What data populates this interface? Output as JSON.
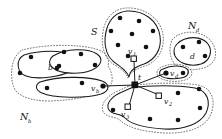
{
  "figure": {
    "background_color": "#ffffff",
    "ink_color": "#111111",
    "dotted_color": "#555555",
    "width": 222,
    "height": 139
  },
  "region_labels": {
    "s": "S",
    "nb_main": "N",
    "nb_sub": "b",
    "nd_main": "N",
    "nd_sub": "d"
  },
  "vertex_labels": {
    "t": "t",
    "v1_main": "v",
    "v1_sub": "1",
    "v2_main": "v",
    "v2_sub": "2",
    "v3_main": "v",
    "v3_sub": "3",
    "vb_main": "v",
    "vb_sub": "b",
    "vd_main": "v",
    "vd_sub": "d",
    "b": "b",
    "d": "d"
  },
  "graph_data": {
    "type": "diagram",
    "hub": {
      "id": "t",
      "x": 135,
      "y": 85,
      "shape": "filled-square"
    },
    "square_nodes": [
      {
        "id": "v1",
        "x": 134,
        "y": 59,
        "shape": "open-square"
      },
      {
        "id": "v2",
        "x": 160,
        "y": 96,
        "shape": "open-square"
      },
      {
        "id": "v3",
        "x": 128,
        "y": 108,
        "shape": "open-square"
      },
      {
        "id": "vb",
        "x": 103,
        "y": 86,
        "shape": "filled-dot"
      },
      {
        "id": "vd",
        "x": 167,
        "y": 73,
        "shape": "filled-dot"
      }
    ],
    "edges": [
      {
        "from": "t",
        "to": "v1"
      },
      {
        "from": "t",
        "to": "v2"
      },
      {
        "from": "t",
        "to": "v3"
      },
      {
        "from": "t",
        "to": "vb"
      },
      {
        "from": "t",
        "to": "vd"
      }
    ],
    "regions": [
      {
        "id": "S",
        "label": "S",
        "style": "solid+dotted",
        "dot_count": 8
      },
      {
        "id": "Nb",
        "label": "N_b",
        "style": "dotted-outer",
        "blob_count": 3
      },
      {
        "id": "Nd",
        "label": "N_d",
        "style": "dotted-outer",
        "blob_count": 2
      }
    ],
    "dots_S": [
      [
        120,
        18
      ],
      [
        139,
        21
      ],
      [
        111,
        31
      ],
      [
        132,
        34
      ],
      [
        153,
        31
      ],
      [
        118,
        45
      ],
      [
        144,
        46
      ],
      [
        127,
        56
      ]
    ],
    "dots_Nb_top": [
      [
        30,
        56
      ],
      [
        20,
        73
      ],
      [
        63,
        51
      ],
      [
        80,
        54
      ],
      [
        95,
        65
      ],
      [
        58,
        66
      ]
    ],
    "dots_Nb_bot": [
      [
        47,
        88
      ],
      [
        82,
        83
      ],
      [
        103,
        86
      ]
    ],
    "dots_Nd": [
      [
        182,
        47
      ],
      [
        198,
        42
      ],
      [
        206,
        55
      ],
      [
        167,
        73
      ],
      [
        183,
        73
      ]
    ],
    "dots_bottom": [
      [
        178,
        92
      ],
      [
        199,
        89
      ],
      [
        113,
        110
      ],
      [
        150,
        118
      ],
      [
        178,
        119
      ],
      [
        199,
        108
      ]
    ]
  }
}
